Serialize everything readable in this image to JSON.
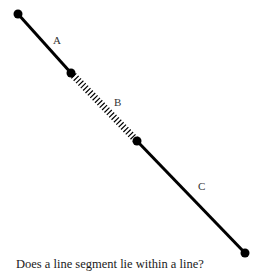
{
  "diagram": {
    "points": [
      {
        "x": 18,
        "y": 14
      },
      {
        "x": 71,
        "y": 73
      },
      {
        "x": 137,
        "y": 141
      },
      {
        "x": 245,
        "y": 253
      }
    ],
    "segments": [
      {
        "label": "A",
        "style": "solid",
        "label_pos": {
          "x": 56,
          "y": 44
        }
      },
      {
        "label": "B",
        "style": "hatched",
        "label_pos": {
          "x": 116,
          "y": 106
        }
      },
      {
        "label": "C",
        "style": "solid",
        "label_pos": {
          "x": 200,
          "y": 190
        }
      }
    ],
    "stroke_color": "#000000"
  },
  "caption": "Does a line segment lie within a line?"
}
